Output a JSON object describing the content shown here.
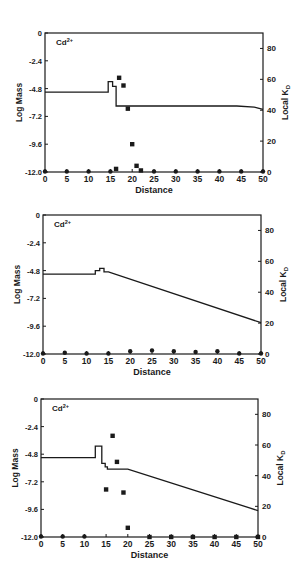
{
  "chart_data": [
    {
      "type": "line",
      "title": "Cd2+",
      "label": "Cd",
      "label_sup": "2+",
      "xlabel": "Distance",
      "ylabel": "Log Mass",
      "y2label": "Local K",
      "y2label_sub": "D",
      "xlim": [
        0,
        50
      ],
      "ylim": [
        -12.0,
        0
      ],
      "y2lim": [
        0,
        90
      ],
      "xticks": [
        0,
        5,
        10,
        15,
        20,
        25,
        30,
        35,
        40,
        45,
        50
      ],
      "yticks": [
        "-12.0",
        "-9.6",
        "-7.2",
        "-4.8",
        "-2.4",
        "0"
      ],
      "y2ticks": [
        "0",
        "20",
        "40",
        "60",
        "80"
      ],
      "grid": false,
      "series": [
        {
          "name": "Log Mass",
          "style": "step-line",
          "x": [
            0,
            14.5,
            14.5,
            15.5,
            15.5,
            16.3,
            16.3,
            44,
            48,
            50
          ],
          "y": [
            -5.1,
            -5.1,
            -4.2,
            -4.2,
            -4.6,
            -4.6,
            -6.3,
            -6.3,
            -6.4,
            -6.6
          ]
        },
        {
          "name": "Local Kd (squares)",
          "style": "square-markers",
          "x": [
            16.3,
            17,
            18,
            19,
            20,
            21,
            22
          ],
          "y": [
            2,
            61,
            56,
            41,
            18,
            4,
            1
          ]
        },
        {
          "name": "Local Kd (circles)",
          "style": "circle-markers",
          "x": [
            0,
            5,
            10,
            15,
            25,
            30,
            35,
            40,
            45,
            50
          ],
          "y": [
            0,
            0,
            0,
            0,
            0,
            0,
            0,
            0,
            0,
            0
          ]
        }
      ]
    },
    {
      "type": "line",
      "title": "Cd2+",
      "label": "Cd",
      "label_sup": "2+",
      "xlabel": "Distance",
      "ylabel": "Log Mass",
      "y2label": "Local K",
      "y2label_sub": "D",
      "xlim": [
        0,
        50
      ],
      "ylim": [
        -12.0,
        0
      ],
      "y2lim": [
        0,
        90
      ],
      "xticks": [
        0,
        5,
        10,
        15,
        20,
        25,
        30,
        35,
        40,
        45,
        50
      ],
      "yticks": [
        "-12.0",
        "-9.6",
        "-7.2",
        "-4.8",
        "-2.4",
        "0"
      ],
      "y2ticks": [
        "0",
        "20",
        "40",
        "60",
        "80"
      ],
      "grid": false,
      "series": [
        {
          "name": "Log Mass",
          "style": "step-line",
          "x": [
            0,
            12,
            12,
            13,
            13,
            14,
            14,
            15,
            50
          ],
          "y": [
            -5.1,
            -5.1,
            -4.8,
            -4.8,
            -4.6,
            -4.6,
            -4.9,
            -4.9,
            -9.3
          ]
        },
        {
          "name": "Local Kd (markers)",
          "style": "circle-markers",
          "x": [
            0,
            5,
            10,
            15,
            20,
            25,
            30,
            35,
            40,
            45,
            50
          ],
          "y": [
            0,
            0.5,
            0,
            0,
            1.5,
            2,
            1.5,
            1,
            1.5,
            0,
            0
          ]
        }
      ]
    },
    {
      "type": "line",
      "title": "Cd2+",
      "label": "Cd",
      "label_sup": "2+",
      "xlabel": "Distance",
      "ylabel": "Log Mass",
      "y2label": "Local K",
      "y2label_sub": "D",
      "xlim": [
        0,
        50
      ],
      "ylim": [
        -12.0,
        0
      ],
      "y2lim": [
        0,
        90
      ],
      "xticks": [
        0,
        5,
        10,
        15,
        20,
        25,
        30,
        35,
        40,
        45,
        50
      ],
      "yticks": [
        "-12.0",
        "-9.6",
        "-7.2",
        "-4.8",
        "-2.4",
        "0"
      ],
      "y2ticks": [
        "0",
        "20",
        "40",
        "60",
        "80"
      ],
      "grid": false,
      "series": [
        {
          "name": "Log Mass",
          "style": "step-line",
          "x": [
            0,
            12.5,
            12.5,
            14,
            14,
            14.8,
            14.8,
            15.3,
            15.3,
            20,
            50
          ],
          "y": [
            -5.1,
            -5.1,
            -4.1,
            -4.1,
            -5.6,
            -5.6,
            -5.9,
            -5.9,
            -6.1,
            -6.1,
            -9.7
          ]
        },
        {
          "name": "Local Kd (squares)",
          "style": "square-markers",
          "x": [
            15,
            16.5,
            17.5,
            19,
            20,
            25,
            30,
            35,
            40,
            45,
            50
          ],
          "y": [
            31,
            66,
            49,
            29,
            6,
            0,
            0,
            0,
            0,
            0,
            0
          ]
        },
        {
          "name": "Local Kd (circles)",
          "style": "circle-markers",
          "x": [
            0,
            5,
            10
          ],
          "y": [
            0,
            0,
            0
          ]
        }
      ]
    }
  ],
  "plots": [
    {
      "top": 0,
      "frame": {
        "x0": 45,
        "x1": 263,
        "y0": 33,
        "y1": 172
      }
    },
    {
      "top": 0,
      "frame": {
        "x0": 43,
        "x1": 261,
        "y0": 215,
        "y1": 354
      }
    },
    {
      "top": 0,
      "frame": {
        "x0": 41,
        "x1": 258,
        "y0": 399,
        "y1": 537
      }
    }
  ]
}
